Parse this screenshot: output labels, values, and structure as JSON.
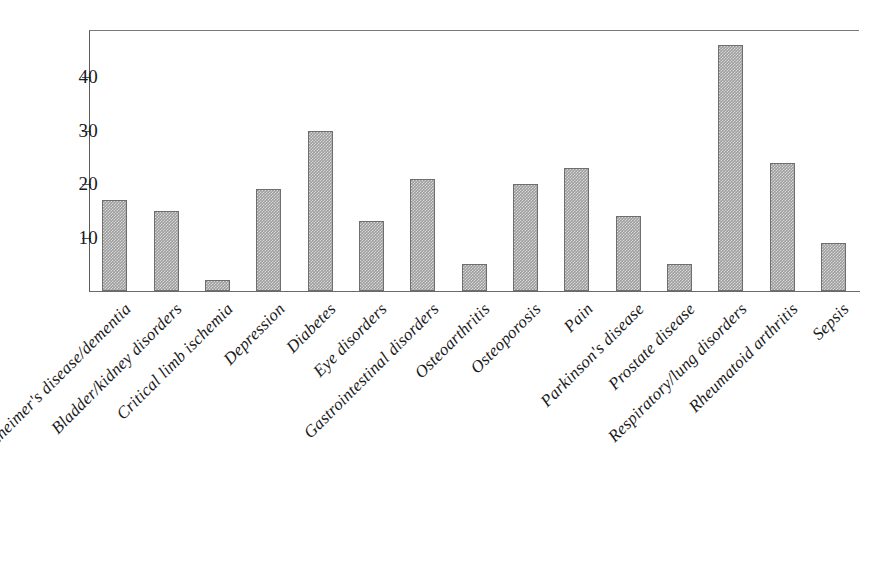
{
  "chart_data": {
    "type": "bar",
    "title": "",
    "subtitle": "",
    "xlabel": "",
    "ylabel": "",
    "ylim": [
      0,
      48
    ],
    "yticks": [
      10,
      20,
      30,
      40
    ],
    "ytick_labels": [
      "10",
      "20",
      "30",
      "40"
    ],
    "grid": false,
    "legend": null,
    "bar_color": "#9d9d9d",
    "bar_edge_color": "#6e6e6e",
    "axis_color": "#5a5a5a",
    "label_rotation": -45,
    "categories": [
      "Alzheimer's disease/dementia",
      "Bladder/kidney disorders",
      "Critical limb ischemia",
      "Depression",
      "Diabetes",
      "Eye disorders",
      "Gastrointestinal disorders",
      "Osteoarthritis",
      "Osteoporosis",
      "Pain",
      "Parkinson's disease",
      "Prostate disease",
      "Respiratory/lung disorders",
      "Rheumatoid arthritis",
      "Sepsis"
    ],
    "values": [
      17,
      15,
      2,
      19,
      30,
      13,
      21,
      5,
      20,
      23,
      14,
      5,
      46,
      24,
      9
    ]
  }
}
